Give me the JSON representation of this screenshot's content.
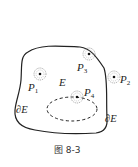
{
  "figure": {
    "caption": "图 8-3",
    "region_label": "E",
    "boundary_label_outer": "∂E",
    "boundary_label_inner": "∂E",
    "points": [
      {
        "name": "P",
        "sub": "1",
        "kind": "interior point"
      },
      {
        "name": "P",
        "sub": "2",
        "kind": "exterior point"
      },
      {
        "name": "P",
        "sub": "3",
        "kind": "boundary point"
      },
      {
        "name": "P",
        "sub": "4",
        "kind": "boundary point of inner hole"
      }
    ],
    "colors": {
      "stroke": "#222222",
      "neighborhood": "#888888",
      "background": "#ffffff"
    }
  }
}
